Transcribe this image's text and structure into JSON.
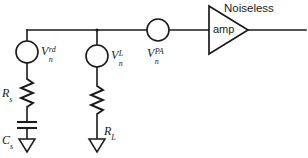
{
  "diagram": {
    "type": "electrical-schematic",
    "line_color": "#1a1a1a",
    "background_color": "#ffffff",
    "sources": [
      {
        "id": "source-noise",
        "symbol": "circle",
        "base": "V",
        "subscript": "n",
        "superscript": "rd",
        "label_full": "V_n^rd",
        "branch": "left"
      },
      {
        "id": "load-noise",
        "symbol": "circle",
        "base": "V",
        "subscript": "n",
        "superscript": "L",
        "label_full": "V_n^L",
        "branch": "middle"
      },
      {
        "id": "preamp-noise",
        "symbol": "circle",
        "base": "V",
        "subscript": "n",
        "superscript": "PA",
        "label_full": "V_n^PA",
        "branch": "series-top"
      }
    ],
    "passives": [
      {
        "id": "source-resistor",
        "symbol": "resistor",
        "base": "R",
        "subscript": "s",
        "label_full": "R_s",
        "branch": "left"
      },
      {
        "id": "source-capacitor",
        "symbol": "capacitor",
        "base": "C",
        "subscript": "s",
        "label_full": "C_s",
        "branch": "left"
      },
      {
        "id": "load-resistor",
        "symbol": "resistor",
        "base": "R",
        "subscript": "L",
        "label_full": "R_L",
        "branch": "middle"
      }
    ],
    "amplifier": {
      "id": "noiseless-amp",
      "symbol": "triangle",
      "caption_above": "Noiseless",
      "caption_inside": "amp"
    },
    "grounds": [
      {
        "id": "ground-left",
        "symbol": "open-triangle-ground"
      },
      {
        "id": "ground-middle",
        "symbol": "open-triangle-ground"
      }
    ]
  }
}
